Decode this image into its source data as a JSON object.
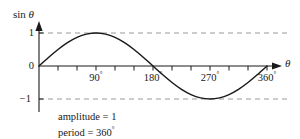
{
  "chart_data": {
    "type": "line",
    "title": "",
    "subtitle": "",
    "xlabel": "θ",
    "ylabel": "sin θ",
    "x": [
      0,
      15,
      30,
      45,
      60,
      75,
      90,
      105,
      120,
      135,
      150,
      165,
      180,
      195,
      210,
      225,
      240,
      255,
      270,
      285,
      300,
      315,
      330,
      345,
      360
    ],
    "values": [
      0,
      0.259,
      0.5,
      0.707,
      0.866,
      0.966,
      1,
      0.966,
      0.866,
      0.707,
      0.5,
      0.259,
      0,
      -0.259,
      -0.5,
      -0.707,
      -0.866,
      -0.966,
      -1,
      -0.966,
      -0.866,
      -0.707,
      -0.5,
      -0.259,
      0
    ],
    "series": [
      {
        "name": "sin θ",
        "values": [
          0,
          0.259,
          0.5,
          0.707,
          0.866,
          0.966,
          1,
          0.966,
          0.866,
          0.707,
          0.5,
          0.259,
          0,
          -0.259,
          -0.5,
          -0.707,
          -0.866,
          -0.966,
          -1,
          -0.966,
          -0.866,
          -0.707,
          -0.5,
          -0.259,
          0
        ]
      }
    ],
    "xlim": [
      0,
      360
    ],
    "ylim": [
      -1,
      1
    ],
    "x_tick_labels": [
      "90°",
      "180°",
      "270°",
      "360°"
    ],
    "x_tick_values": [
      90,
      180,
      270,
      360
    ],
    "x_minor_tick_interval": 30,
    "y_tick_labels": [
      "1",
      "0",
      "−1"
    ],
    "y_tick_values": [
      1,
      0,
      -1
    ],
    "grid": false,
    "guide_lines": [
      1,
      -1
    ],
    "guide_line_style": "dashed",
    "legend": "none",
    "curve_color": "#1a1a1a",
    "guide_color": "#9a9a9a",
    "axis_color": "#1a1a1a",
    "background_color": "#ffffff",
    "annotations": [
      "amplitude = 1",
      "period = 360°"
    ]
  },
  "axes": {
    "y_axis_label_main": "sin",
    "y_axis_label_symbol": "θ",
    "x_axis_label": "θ"
  },
  "ticks": {
    "y": {
      "one": "1",
      "zero": "0",
      "minus_one": "−1"
    },
    "x": {
      "ninety": "90",
      "one_eighty": "180",
      "two_seventy": "270",
      "three_sixty": "360",
      "degree_symbol": "°"
    }
  },
  "notes": {
    "amplitude": "amplitude = 1",
    "period_text": "period = 360",
    "period_degree": "°"
  }
}
